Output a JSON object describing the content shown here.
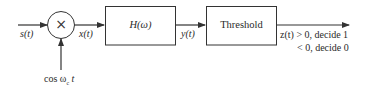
{
  "diagram": {
    "type": "block-diagram",
    "input_label": "s(t)",
    "mixer": {
      "symbol": "×",
      "carrier_label": "cos ω",
      "carrier_subscript": "c",
      "carrier_suffix": " t"
    },
    "mixer_output_label": "x(t)",
    "filter_block": {
      "label": "H(ω)"
    },
    "filter_output_label": "y(t)",
    "threshold_block": {
      "label": "Threshold"
    },
    "decision": {
      "line1": "z(t) > 0, decide 1",
      "line2": "< 0, decide 0"
    },
    "colors": {
      "stroke": "#333333",
      "text": "#2a2a2a",
      "background": "#ffffff"
    }
  }
}
